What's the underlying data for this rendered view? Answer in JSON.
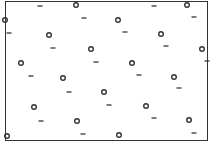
{
  "diagram": {
    "symbols": {
      "circle": "circle-particle",
      "dash": "dash-particle"
    },
    "rows": [
      {
        "items": [
          "dash",
          "circle",
          "dash",
          "circle"
        ]
      },
      {
        "items": [
          "circle",
          "dash",
          "circle",
          "dash"
        ]
      },
      {
        "items": [
          "dash",
          "circle",
          "dash",
          "circle",
          "dash"
        ]
      },
      {
        "items": [
          "dash",
          "circle",
          "dash",
          "circle"
        ]
      },
      {
        "items": [
          "circle",
          "dash",
          "circle",
          "dash"
        ]
      },
      {
        "items": [
          "dash",
          "circle",
          "dash",
          "circle",
          "dash"
        ]
      },
      {
        "items": [
          "circle",
          "dash",
          "circle",
          "dash"
        ]
      },
      {
        "items": [
          "dash",
          "circle",
          "dash",
          "circle"
        ]
      },
      {
        "items": [
          "circle",
          "dash",
          "circle",
          "dash"
        ]
      }
    ],
    "colors": {
      "ink": "#333333",
      "background": "#ffffff"
    }
  }
}
